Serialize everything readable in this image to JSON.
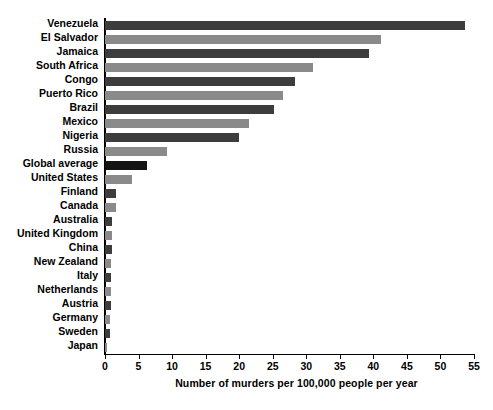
{
  "chart_data": {
    "type": "bar",
    "orientation": "horizontal",
    "title": "",
    "xlabel": "Number of murders per 100,000 people per year",
    "ylabel": "",
    "xlim": [
      0,
      55
    ],
    "xticks": [
      0,
      5,
      10,
      15,
      20,
      25,
      30,
      35,
      40,
      45,
      50,
      55
    ],
    "grid": false,
    "legend": "none",
    "categories": [
      "Venezuela",
      "El Salvador",
      "Jamaica",
      "South Africa",
      "Congo",
      "Puerto Rico",
      "Brazil",
      "Mexico",
      "Nigeria",
      "Russia",
      "Global average",
      "United States",
      "Finland",
      "Canada",
      "Australia",
      "United Kingdom",
      "China",
      "New Zealand",
      "Italy",
      "Netherlands",
      "Austria",
      "Germany",
      "Sweden",
      "Japan"
    ],
    "values": [
      53.7,
      41.2,
      39.3,
      31.0,
      28.3,
      26.5,
      25.2,
      21.5,
      20.0,
      9.2,
      6.2,
      4.0,
      1.6,
      1.6,
      1.1,
      1.0,
      1.0,
      0.9,
      0.9,
      0.9,
      0.9,
      0.8,
      0.7,
      0.3
    ],
    "bar_colors": [
      "#3d3d3d",
      "#8a8a8a",
      "#3d3d3d",
      "#8a8a8a",
      "#3d3d3d",
      "#8a8a8a",
      "#3d3d3d",
      "#8a8a8a",
      "#3d3d3d",
      "#8a8a8a",
      "#141414",
      "#8a8a8a",
      "#3d3d3d",
      "#8a8a8a",
      "#3d3d3d",
      "#8a8a8a",
      "#3d3d3d",
      "#8a8a8a",
      "#3d3d3d",
      "#8a8a8a",
      "#3d3d3d",
      "#8a8a8a",
      "#3d3d3d",
      "#8a8a8a"
    ],
    "highlighted_category": "Global average",
    "colors": {
      "bar_dark": "#3d3d3d",
      "bar_light": "#8a8a8a",
      "bar_highlight": "#141414",
      "axis": "#000000",
      "background": "#ffffff",
      "text": "#000000"
    }
  }
}
